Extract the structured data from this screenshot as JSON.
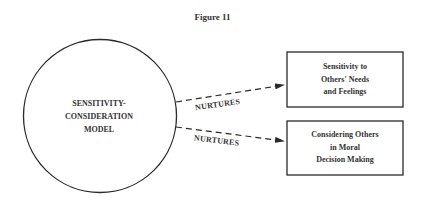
{
  "figure": {
    "title": "Figure 11"
  },
  "nodes": {
    "center": {
      "shape": "circle",
      "lines": [
        "SENSITIVITY-",
        "CONSIDERATION",
        "MODEL"
      ]
    },
    "targets": [
      {
        "shape": "rectangle",
        "lines": [
          "Sensitivity to",
          "Others' Needs",
          "and Feelings"
        ]
      },
      {
        "shape": "rectangle",
        "lines": [
          "Considering Others",
          "in Moral",
          "Decision Making"
        ]
      }
    ]
  },
  "edges": [
    {
      "from": "center",
      "to": "targets.0",
      "style": "dashed-arrow",
      "label": "NURTURES"
    },
    {
      "from": "center",
      "to": "targets.1",
      "style": "dashed-arrow",
      "label": "NURTURES"
    }
  ],
  "colors": {
    "stroke": "#2a2a2a",
    "background": "#ffffff"
  }
}
